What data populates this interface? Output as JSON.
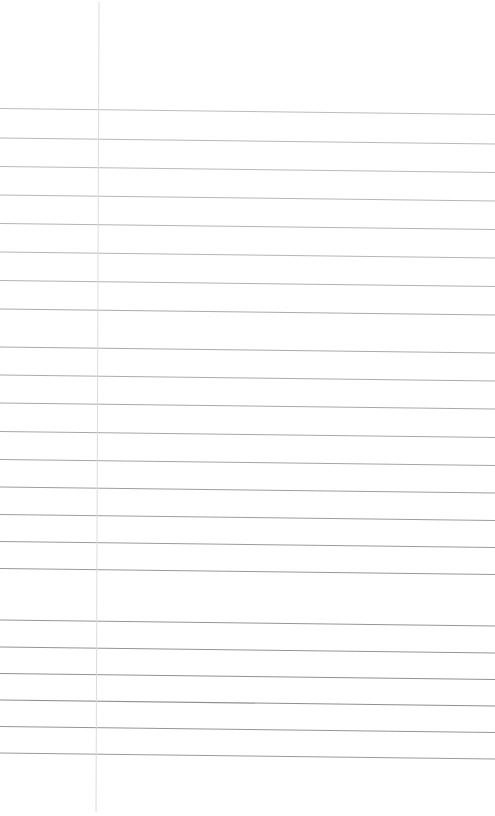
{
  "page": {
    "kind": "scanned-lined-notebook-page",
    "width": 495,
    "height": 816,
    "background_color": "#ffffff",
    "text_content": "",
    "visible_text_present": false
  },
  "ruling": {
    "horizontal_line_count": 23,
    "vertical_margin_line_count": 1,
    "line_color": "#a9a9a9",
    "line_color_faint": "#c9c9c9",
    "line_color_strong": "#8f8f8f",
    "margin_line_color": "#dcdcdc",
    "skew_note": "lines descend slightly left-to-right",
    "horizontal_lines": [
      {
        "index": 1,
        "y_left": 108.5,
        "y_right": 114.5,
        "color": "#b4b4b4",
        "width": 0.9
      },
      {
        "index": 2,
        "y_left": 138.0,
        "y_right": 144.0,
        "color": "#b0b0b0",
        "width": 0.9
      },
      {
        "index": 3,
        "y_left": 166.5,
        "y_right": 172.5,
        "color": "#b2b2b2",
        "width": 0.9
      },
      {
        "index": 4,
        "y_left": 195.0,
        "y_right": 201.0,
        "color": "#aeaeae",
        "width": 0.9
      },
      {
        "index": 5,
        "y_left": 223.5,
        "y_right": 229.5,
        "color": "#ababab",
        "width": 0.9
      },
      {
        "index": 6,
        "y_left": 252.0,
        "y_right": 258.0,
        "color": "#adadad",
        "width": 0.9
      },
      {
        "index": 7,
        "y_left": 280.5,
        "y_right": 286.5,
        "color": "#a9a9a9",
        "width": 0.9
      },
      {
        "index": 8,
        "y_left": 309.0,
        "y_right": 315.0,
        "color": "#a7a7a7",
        "width": 0.95
      },
      {
        "index": 9,
        "y_left": 347.0,
        "y_right": 353.0,
        "color": "#a5a5a5",
        "width": 0.95
      },
      {
        "index": 10,
        "y_left": 375.0,
        "y_right": 381.0,
        "color": "#a6a6a6",
        "width": 0.95
      },
      {
        "index": 11,
        "y_left": 403.0,
        "y_right": 409.0,
        "color": "#a3a3a3",
        "width": 0.95
      },
      {
        "index": 12,
        "y_left": 431.5,
        "y_right": 437.5,
        "color": "#a2a2a2",
        "width": 0.95
      },
      {
        "index": 13,
        "y_left": 459.5,
        "y_right": 465.5,
        "color": "#a0a0a0",
        "width": 0.95
      },
      {
        "index": 14,
        "y_left": 487.0,
        "y_right": 493.0,
        "color": "#9e9e9e",
        "width": 1.0
      },
      {
        "index": 15,
        "y_left": 514.5,
        "y_right": 520.5,
        "color": "#9d9d9d",
        "width": 1.0
      },
      {
        "index": 16,
        "y_left": 541.5,
        "y_right": 547.5,
        "color": "#9b9b9b",
        "width": 1.0
      },
      {
        "index": 17,
        "y_left": 568.5,
        "y_right": 574.5,
        "color": "#999999",
        "width": 1.0
      },
      {
        "index": 18,
        "y_left": 620.0,
        "y_right": 626.0,
        "color": "#969696",
        "width": 1.0
      },
      {
        "index": 19,
        "y_left": 647.0,
        "y_right": 653.0,
        "color": "#949494",
        "width": 1.0
      },
      {
        "index": 20,
        "y_left": 673.5,
        "y_right": 679.5,
        "color": "#929292",
        "width": 1.0
      },
      {
        "index": 21,
        "y_left": 700.0,
        "y_right": 706.0,
        "color": "#8f8f8f",
        "width": 1.05
      },
      {
        "index": 22,
        "y_left": 726.5,
        "y_right": 732.5,
        "color": "#959595",
        "width": 1.0
      },
      {
        "index": 23,
        "y_left": 753.0,
        "y_right": 759.0,
        "color": "#9a9a9a",
        "width": 1.0
      }
    ],
    "margin_line": {
      "x_top": 99.0,
      "x_bottom": 96.0,
      "y_start": 2.0,
      "y_end": 812.0,
      "color": "#dcdcdc",
      "width": 1.0
    }
  }
}
